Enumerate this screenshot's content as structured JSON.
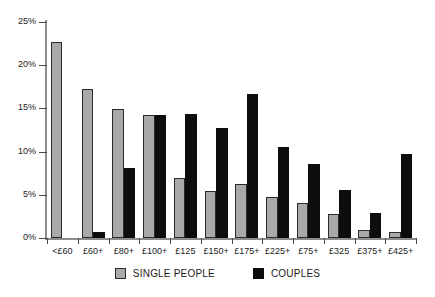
{
  "chart_data": {
    "type": "bar",
    "title": "",
    "xlabel": "",
    "ylabel": "",
    "ylim": [
      0,
      25
    ],
    "grid": false,
    "legend_position": "bottom-center",
    "ytick_labels": [
      "25%",
      "20%",
      "15%",
      "10%",
      "5%",
      "0%"
    ],
    "ytick_values": [
      25,
      20,
      15,
      10,
      5,
      0
    ],
    "categories": [
      "<£60",
      "£60+",
      "£80+",
      "£100+",
      "£125",
      "£150+",
      "£175+",
      "£225+",
      "£75+",
      "£325",
      "£375+",
      "£425+"
    ],
    "series": [
      {
        "name": "SINGLE PEOPLE",
        "color": "#a9a9a9",
        "values": [
          22.7,
          17.3,
          14.9,
          14.2,
          7.0,
          5.4,
          6.2,
          4.8,
          4.1,
          2.8,
          0.9,
          0.7
        ]
      },
      {
        "name": "COUPLES",
        "color": "#0d0d0d",
        "values": [
          0.0,
          0.7,
          8.1,
          14.2,
          14.4,
          12.7,
          16.7,
          10.5,
          8.6,
          5.5,
          2.9,
          9.7
        ]
      }
    ]
  },
  "legend": {
    "items": [
      {
        "label": "SINGLE PEOPLE",
        "swatch": "single"
      },
      {
        "label": "COUPLES",
        "swatch": "couple"
      }
    ]
  }
}
